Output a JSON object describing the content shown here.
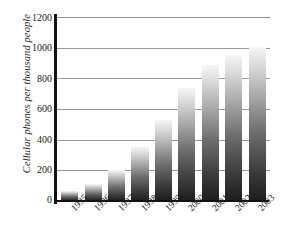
{
  "chart_data": {
    "type": "bar",
    "title": "",
    "xlabel": "",
    "ylabel": "Cellular phones per thousand people",
    "categories": [
      "1995",
      "1996",
      "1997",
      "1998",
      "1999",
      "2000",
      "2001",
      "2002",
      "2003"
    ],
    "values": [
      65,
      110,
      200,
      350,
      530,
      735,
      890,
      950,
      1005
    ],
    "ylim": [
      0,
      1200
    ],
    "ytick_labels": [
      "0",
      "200",
      "400",
      "600",
      "800",
      "1000",
      "1200"
    ],
    "ytick_values": [
      0,
      200,
      400,
      600,
      800,
      1000,
      1200
    ],
    "grid": true,
    "legend": "none",
    "bar_style": "vertical-gradient-grayscale",
    "bar_color_bottom": "#1c1c1c",
    "bar_color_top": "#f6f6f6",
    "axis_color": "#111111",
    "gridline_color": "#9a9a9a",
    "background": "#ffffff"
  }
}
